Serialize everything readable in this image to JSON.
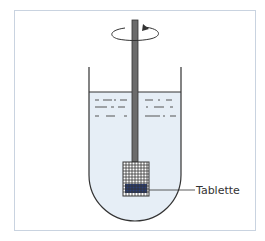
{
  "diagram": {
    "title": "",
    "labels": {
      "tablet": "Tablette"
    },
    "components": [
      "outer-frame",
      "vessel",
      "liquid",
      "stirring-shaft",
      "rotation-arrow",
      "basket-mesh",
      "tablet"
    ],
    "colors": {
      "frame_border": "#c9d3e0",
      "liquid": "#e6eef6",
      "shaft": "#6b6b6b",
      "tablet": "#2b3f78",
      "outline": "#333333"
    }
  }
}
